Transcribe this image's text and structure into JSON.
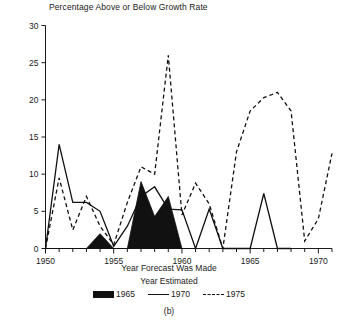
{
  "chart_data": {
    "type": "line",
    "title": "Percentage Above or Below Growth Rate",
    "xlabel": "Year Forecast Was Made",
    "ylabel": "",
    "panel_label": "(b)",
    "legend_title": "Year Estimated",
    "legend_position": "bottom",
    "grid": false,
    "xlim": [
      1950,
      1971
    ],
    "ylim": [
      0,
      30
    ],
    "xticks": [
      1950,
      1955,
      1960,
      1965,
      1970
    ],
    "xtick_labels": [
      "1950",
      "1955",
      "1960",
      "1965",
      "1970"
    ],
    "yticks": [
      0,
      5,
      10,
      15,
      20,
      25,
      30
    ],
    "ytick_labels": [
      "0",
      "5",
      "10",
      "15",
      "20",
      "25",
      "30"
    ],
    "xtick_minor_step": 1,
    "series": [
      {
        "name": "1965",
        "style": "filled-area",
        "color": "#111111",
        "x": [
          1950,
          1951,
          1952,
          1953,
          1954,
          1955,
          1956,
          1957,
          1958,
          1959,
          1960,
          1961
        ],
        "values": [
          0,
          0,
          0,
          0,
          2.0,
          0,
          0,
          9.0,
          4.3,
          7.0,
          0,
          0
        ]
      },
      {
        "name": "1970",
        "style": "solid-line",
        "color": "#111111",
        "x": [
          1950,
          1951,
          1952,
          1953,
          1954,
          1955,
          1956,
          1957,
          1958,
          1959,
          1960,
          1961,
          1962,
          1963,
          1964,
          1965,
          1966,
          1967,
          1968
        ],
        "values": [
          0,
          14.0,
          6.2,
          6.2,
          5.0,
          0.3,
          3.0,
          7.0,
          8.3,
          5.3,
          5.2,
          0,
          5.3,
          0,
          0,
          0,
          7.4,
          0,
          0
        ]
      },
      {
        "name": "1975",
        "style": "dashed-line",
        "color": "#111111",
        "x": [
          1950,
          1951,
          1952,
          1953,
          1954,
          1955,
          1956,
          1957,
          1958,
          1959,
          1960,
          1961,
          1962,
          1963,
          1964,
          1965,
          1966,
          1967,
          1968,
          1969,
          1970,
          1971
        ],
        "values": [
          0,
          9.5,
          2.5,
          7.0,
          3.0,
          0.5,
          6.2,
          11.0,
          10.0,
          26.0,
          4.5,
          8.8,
          6.0,
          0,
          13.0,
          18.5,
          20.3,
          21.0,
          18.5,
          1.0,
          4.0,
          12.8
        ]
      }
    ]
  },
  "legend": {
    "items": [
      {
        "label": "1965",
        "swatch": "fill"
      },
      {
        "label": "1970",
        "swatch": "solid"
      },
      {
        "label": "1975",
        "swatch": "dash"
      }
    ]
  }
}
